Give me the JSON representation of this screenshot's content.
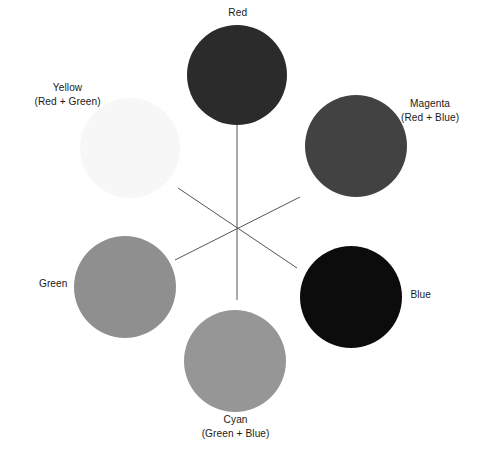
{
  "center": {
    "x": 237,
    "y": 229
  },
  "spokes": [
    {
      "x1": 237,
      "y1": 125,
      "x2": 237,
      "y2": 300
    },
    {
      "x1": 178,
      "y1": 188,
      "x2": 297,
      "y2": 268
    },
    {
      "x1": 175,
      "y1": 260,
      "x2": 300,
      "y2": 197
    }
  ],
  "spoke_color": "#555555",
  "colors": [
    {
      "id": "red",
      "name": "Red",
      "mix": "",
      "cx": 237,
      "cy": 75,
      "r": 50,
      "fill": "#2b2b2b",
      "label": {
        "x": 237,
        "y": 12
      }
    },
    {
      "id": "magenta",
      "name": "Magenta",
      "mix": "(Red + Blue)",
      "cx": 356,
      "cy": 146,
      "r": 51,
      "fill": "#424242",
      "label": {
        "x": 430,
        "y": 103
      }
    },
    {
      "id": "blue",
      "name": "Blue",
      "mix": "",
      "cx": 351,
      "cy": 297,
      "r": 51,
      "fill": "#0c0c0c",
      "label": {
        "x": 420,
        "y": 294
      }
    },
    {
      "id": "cyan",
      "name": "Cyan",
      "mix": "(Green + Blue)",
      "cx": 235,
      "cy": 361,
      "r": 51,
      "fill": "#969696",
      "label": {
        "x": 235,
        "y": 419
      }
    },
    {
      "id": "green",
      "name": "Green",
      "mix": "",
      "cx": 125,
      "cy": 287,
      "r": 51,
      "fill": "#8f8f8f",
      "label": {
        "x": 53,
        "y": 283
      }
    },
    {
      "id": "yellow",
      "name": "Yellow",
      "mix": "(Red + Green)",
      "cx": 130,
      "cy": 148,
      "r": 50,
      "fill": "#f7f7f7",
      "label": {
        "x": 67,
        "y": 87
      }
    }
  ]
}
